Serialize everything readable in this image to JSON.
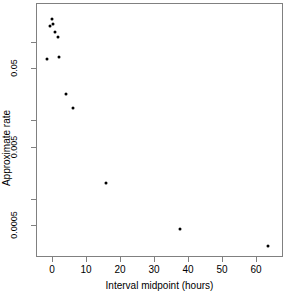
{
  "chart_data": {
    "type": "scatter",
    "title": "",
    "xlabel": "Interval midpoint (hours)",
    "ylabel": "Approximate rate",
    "xlim": [
      -4.5,
      68
    ],
    "ylim_log": [
      0.00018,
      0.115
    ],
    "y_scale": "log",
    "grid": false,
    "legend": null,
    "xticks": [
      0,
      10,
      20,
      30,
      40,
      50,
      60
    ],
    "xtick_labels": [
      "0",
      "10",
      "20",
      "30",
      "40",
      "50",
      "60"
    ],
    "yticks": [
      0.05,
      0.005,
      0.0005
    ],
    "ytick_labels": [
      "0.05",
      "0.005",
      "0.0005"
    ],
    "ytick_minor": [
      0.1,
      0.01,
      0.001
    ],
    "point_color": "#000000",
    "frame_color": "#808080",
    "x": [
      0.5,
      1.0,
      1.2,
      1.5,
      2.5,
      0.25,
      3.0,
      5.0,
      7.0,
      16.0,
      36.0,
      60.0
    ],
    "y": [
      0.091,
      0.079,
      0.084,
      0.078,
      0.069,
      0.051,
      0.052,
      0.0285,
      0.0215,
      0.0022,
      0.00043,
      0.00025
    ],
    "points": [
      {
        "x": 0.5,
        "y": 0.091,
        "px": 16,
        "py": 16
      },
      {
        "x": 1.0,
        "y": 0.079,
        "px": 14,
        "py": 23
      },
      {
        "x": 1.2,
        "y": 0.084,
        "px": 17,
        "py": 21
      },
      {
        "x": 1.5,
        "y": 0.078,
        "px": 19,
        "py": 29
      },
      {
        "x": 2.5,
        "y": 0.069,
        "px": 22,
        "py": 34
      },
      {
        "x": 0.25,
        "y": 0.051,
        "px": 11,
        "py": 56
      },
      {
        "x": 3.0,
        "y": 0.052,
        "px": 23,
        "py": 54
      },
      {
        "x": 5.0,
        "y": 0.0285,
        "px": 30,
        "py": 91
      },
      {
        "x": 7.0,
        "y": 0.0215,
        "px": 37,
        "py": 105
      },
      {
        "x": 16.0,
        "y": 0.0022,
        "px": 70,
        "py": 180
      },
      {
        "x": 36.0,
        "y": 0.00043,
        "px": 144,
        "py": 226
      },
      {
        "x": 60.0,
        "y": 0.00025,
        "px": 232,
        "py": 243
      }
    ],
    "xtick_px": [
      52,
      86,
      120,
      154,
      188,
      222,
      256
    ],
    "ytick_px": [
      68,
      147,
      225
    ],
    "ytick_minor_px": [
      42,
      120,
      199
    ]
  },
  "axes": {
    "y_title": "Approximate rate",
    "x_title": "Interval midpoint (hours)"
  }
}
